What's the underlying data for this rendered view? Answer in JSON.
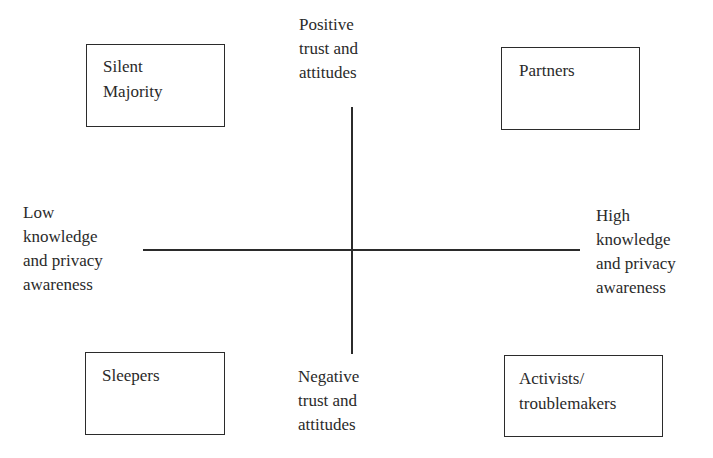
{
  "diagram": {
    "type": "quadrant",
    "axes": {
      "vertical": {
        "top_label": "Positive\ntrust and\nattitudes",
        "bottom_label": "Negative\ntrust and\nattitudes"
      },
      "horizontal": {
        "left_label": "Low\nknowledge\nand privacy\nawareness",
        "right_label": "High\nknowledge\nand privacy\nawareness"
      }
    },
    "quadrants": {
      "top_left": {
        "label": "Silent\nMajority"
      },
      "top_right": {
        "label": "Partners"
      },
      "bottom_left": {
        "label": "Sleepers"
      },
      "bottom_right": {
        "label": "Activists/\ntroublemakers"
      }
    },
    "colors": {
      "line": "#2b2b2b",
      "text": "#2a2a2a",
      "background": "#ffffff"
    }
  }
}
